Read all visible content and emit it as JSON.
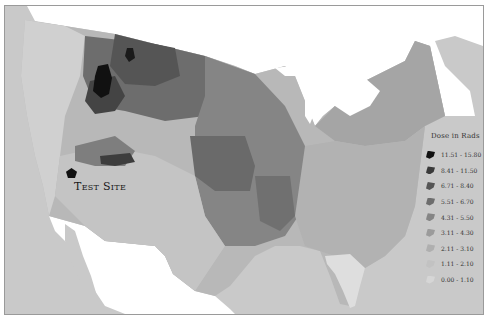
{
  "map": {
    "type": "choropleth",
    "region": "United States (contiguous), county-level",
    "annotations": {
      "test_site_label": "Test Site"
    },
    "colors": {
      "ocean": "#c9c9c9",
      "foreign_land": "#ffffff",
      "frame_border": "#9a9a9a"
    }
  },
  "legend": {
    "title": "Dose in Rads",
    "items": [
      {
        "label": "11.51 - 15.80",
        "color": "#111111"
      },
      {
        "label": "8.41 - 11.50",
        "color": "#3a3a3a"
      },
      {
        "label": "6.71 - 8.40",
        "color": "#555555"
      },
      {
        "label": "5.51 - 6.70",
        "color": "#6d6d6d"
      },
      {
        "label": "4.31 - 5.50",
        "color": "#858585"
      },
      {
        "label": "3.11 - 4.30",
        "color": "#9b9b9b"
      },
      {
        "label": "2.11 - 3.10",
        "color": "#afafaf"
      },
      {
        "label": "1.11 - 2.10",
        "color": "#c2c2c2"
      },
      {
        "label": "0.00 - 1.10",
        "color": "#d6d6d6"
      }
    ]
  }
}
